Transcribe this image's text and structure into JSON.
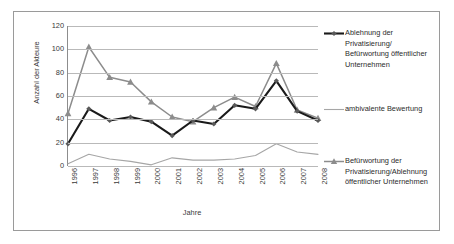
{
  "chart_data": {
    "type": "line",
    "title": "",
    "subtitle": "",
    "xlabel": "Jahre",
    "ylabel": "Anzahl der Akteure",
    "categories": [
      "1996",
      "1997",
      "1998",
      "1999",
      "2000",
      "2001",
      "2002",
      "2003",
      "2004",
      "2005",
      "2006",
      "2007",
      "2008"
    ],
    "x": [
      1996,
      1997,
      1998,
      1999,
      2000,
      2001,
      2002,
      2003,
      2004,
      2005,
      2006,
      2007,
      2008
    ],
    "ylim": [
      0,
      120
    ],
    "yticks": [
      0,
      20,
      40,
      60,
      80,
      100,
      120
    ],
    "grid": true,
    "legend_position": "right",
    "series": [
      {
        "name": "Ablehnung der Privatisierung/Befürwortung öffentlicher Unternehmen",
        "color": "#1a1a1a",
        "marker": "diamond",
        "values": [
          19,
          49,
          39,
          42,
          38,
          26,
          39,
          36,
          52,
          49,
          73,
          47,
          39
        ]
      },
      {
        "name": "ambivalente Bewertung",
        "color": "#a6a6a6",
        "marker": "none",
        "values": [
          2,
          10,
          6,
          4,
          1,
          7,
          5,
          5,
          6,
          9,
          19,
          12,
          10
        ]
      },
      {
        "name": "Befürwortung der Privatisierung/Ablehnung öffentlicher Unternehmen",
        "color": "#8c8c8c",
        "marker": "triangle",
        "values": [
          45,
          102,
          76,
          72,
          55,
          42,
          38,
          50,
          59,
          51,
          88,
          48,
          41
        ]
      }
    ]
  },
  "axes": {
    "y_title": "Anzahl der Akteure",
    "x_title": "Jahre",
    "y_tick_labels": [
      "120",
      "100",
      "80",
      "60",
      "40",
      "20",
      "0"
    ],
    "x_tick_labels": [
      "1996",
      "1997",
      "1998",
      "1999",
      "2000",
      "2001",
      "2002",
      "2003",
      "2004",
      "2005",
      "2006",
      "2007",
      "2008"
    ]
  },
  "legend": {
    "items": [
      {
        "label": "Ablehnung der Privatisierung/ Befürwortung öffentlicher Unternehmen",
        "color": "#1a1a1a",
        "marker": "diamond-marker"
      },
      {
        "label": "ambivalente Bewertung",
        "color": "#a6a6a6",
        "marker": "plain-line"
      },
      {
        "label": "Befürwortung der Privatisierung/Ablehnung öffentlicher Unternehmen",
        "color": "#8c8c8c",
        "marker": "triangle-marker"
      }
    ]
  }
}
